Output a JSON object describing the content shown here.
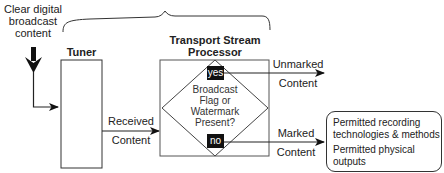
{
  "input": {
    "label_lines": [
      "Clear digital",
      "broadcast",
      "content"
    ]
  },
  "tuner": {
    "title": "Tuner"
  },
  "tsp": {
    "title_lines": [
      "Transport Stream",
      "Processor"
    ]
  },
  "decision": {
    "question_lines": [
      "Broadcast",
      "Flag or",
      "Watermark",
      "Present?"
    ],
    "yes_label": "yes",
    "no_label": "no"
  },
  "edges": {
    "received": [
      "Received",
      "Content"
    ],
    "unmarked": [
      "Unmarked",
      "Content"
    ],
    "marked": [
      "Marked",
      "Content"
    ]
  },
  "output_box": {
    "items": [
      [
        "Permitted recording",
        "technologies & methods"
      ],
      [
        "Permitted physical",
        "outputs"
      ]
    ]
  }
}
